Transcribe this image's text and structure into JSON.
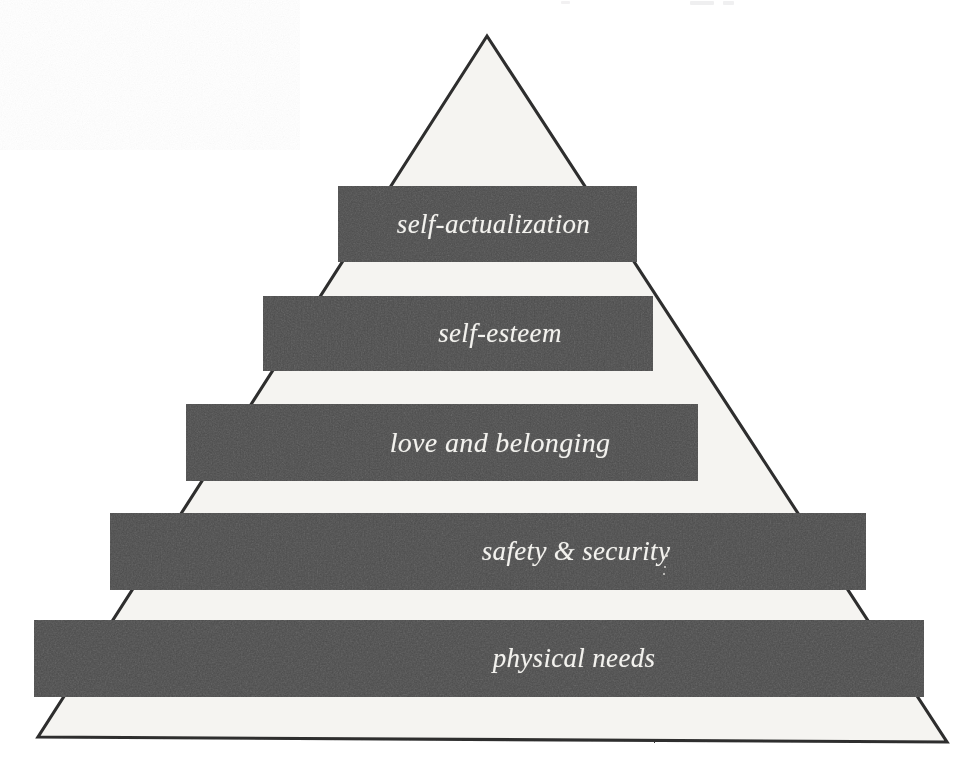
{
  "figure": {
    "kind": "maslow-hierarchy-of-needs-pyramid",
    "title": "",
    "background_color": "#ffffff",
    "outline_color": "#2e2e2e",
    "pyramid_fill_color": "#f5f4f1",
    "band_color": "#4b4b4b",
    "band_text_color": "#f3f2ee",
    "apex": {
      "x": 487,
      "y": 36
    },
    "base_left": {
      "x": 38,
      "y": 737
    },
    "base_right": {
      "x": 947,
      "y": 742
    }
  },
  "chart_data": {
    "type": "pyramid",
    "orientation": "bottom-widest",
    "level_count": 5,
    "categories": [
      "self-actualization",
      "self-esteem",
      "love and belonging",
      "safety & security",
      "physical needs"
    ],
    "values": [
      1,
      2,
      3,
      4,
      5
    ],
    "band_widths_px": [
      299,
      390,
      512,
      756,
      890
    ],
    "legend": [],
    "xlabel": "",
    "ylabel": ""
  },
  "levels": [
    {
      "rank": 1,
      "label": "self-actualization",
      "left": 338,
      "top": 186,
      "width": 299,
      "height": 76,
      "font_size": 27,
      "text_offset": 6
    },
    {
      "rank": 2,
      "label": "self-esteem",
      "left": 263,
      "top": 296,
      "width": 390,
      "height": 75,
      "font_size": 27,
      "text_offset": 42
    },
    {
      "rank": 3,
      "label": "love and belonging",
      "left": 186,
      "top": 404,
      "width": 512,
      "height": 77,
      "font_size": 28,
      "text_offset": 58
    },
    {
      "rank": 4,
      "label": "safety & security",
      "left": 110,
      "top": 513,
      "width": 756,
      "height": 77,
      "font_size": 27,
      "text_offset": 88
    },
    {
      "rank": 5,
      "label": "physical needs",
      "left": 34,
      "top": 620,
      "width": 890,
      "height": 77,
      "font_size": 27,
      "text_offset": 95
    }
  ],
  "specks": [
    {
      "left": 665,
      "top": 554,
      "size": 3
    },
    {
      "left": 664,
      "top": 566,
      "size": 2
    },
    {
      "left": 663,
      "top": 573,
      "size": 2
    }
  ],
  "top_artifacts": [
    {
      "left": 561,
      "top": 1,
      "width": 9,
      "height": 3
    },
    {
      "left": 690,
      "top": 1,
      "width": 24,
      "height": 4
    },
    {
      "left": 723,
      "top": 1,
      "width": 11,
      "height": 4
    }
  ]
}
